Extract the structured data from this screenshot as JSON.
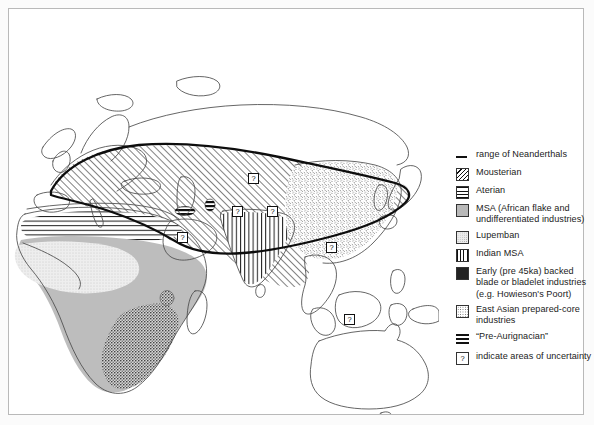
{
  "figure": {
    "type": "thematic-map"
  },
  "legend": {
    "items": [
      {
        "swatch": "line-symbol",
        "label": "range of Neanderthals"
      },
      {
        "swatch": "diagonal-hatch-swatch",
        "label": "Mousterian"
      },
      {
        "swatch": "horizontal-hatch-swatch",
        "label": "Aterian"
      },
      {
        "swatch": "solid-gray-swatch",
        "label": "MSA (African flake and undifferentiated industries)"
      },
      {
        "swatch": "light-stipple-swatch",
        "label": "Lupemban"
      },
      {
        "swatch": "vertical-hatch-swatch",
        "label": "Indian MSA"
      },
      {
        "swatch": "dense-stipple-swatch",
        "label": "Early (pre 45ka) backed blade or bladelet industries (e.g. Howieson's Poort)"
      },
      {
        "swatch": "speckle-swatch",
        "label": "East Asian prepared-core industries"
      },
      {
        "swatch": "thick-bar-swatch",
        "label": "“Pre-Aurignacian”"
      },
      {
        "swatch": "question-box-swatch",
        "label": "indicate areas of uncertainty"
      }
    ],
    "uncertainty_glyph": "?"
  },
  "map": {
    "uncertainty_markers": [
      {
        "name": "uncertainty-marker-central-asia",
        "x": 244,
        "y": 169
      },
      {
        "name": "uncertainty-marker-arabia",
        "x": 173,
        "y": 228
      },
      {
        "name": "uncertainty-marker-india-west",
        "x": 228,
        "y": 202
      },
      {
        "name": "uncertainty-marker-india-east",
        "x": 263,
        "y": 202
      },
      {
        "name": "uncertainty-marker-east-asia",
        "x": 322,
        "y": 238
      },
      {
        "name": "uncertainty-marker-southeast-asia",
        "x": 340,
        "y": 310
      }
    ],
    "regions": [
      {
        "name": "mousterian-region",
        "industry": "Mousterian",
        "area": "Europe, Near East, Central Asia"
      },
      {
        "name": "aterian-region",
        "industry": "Aterian",
        "area": "North Africa / Sahara"
      },
      {
        "name": "msa-region",
        "industry": "MSA",
        "area": "Sub-Saharan Africa"
      },
      {
        "name": "lupemban-region",
        "industry": "Lupemban",
        "area": "Congo basin / West-Central Africa"
      },
      {
        "name": "indian-msa-region",
        "industry": "Indian MSA",
        "area": "Indian subcontinent"
      },
      {
        "name": "howiesons-poort-region",
        "industry": "Early backed blade industries",
        "area": "Southern Africa and East Africa"
      },
      {
        "name": "east-asian-region",
        "industry": "East Asian prepared-core industries",
        "area": "China and East Asia"
      },
      {
        "name": "pre-aurignacian-region",
        "industry": "Pre-Aurignacian",
        "area": "Levant and Near East"
      }
    ],
    "neanderthal_range_boundary": "thick black line enclosing Europe, Near East and Central Asia"
  },
  "colors": {
    "ink": "#111111",
    "coastline": "#4a4a4a",
    "msa_gray": "#b9b9b9",
    "lupemban_gray": "#ececec",
    "frame": "#b9b9b9",
    "page_background": "#fbfbfb"
  }
}
